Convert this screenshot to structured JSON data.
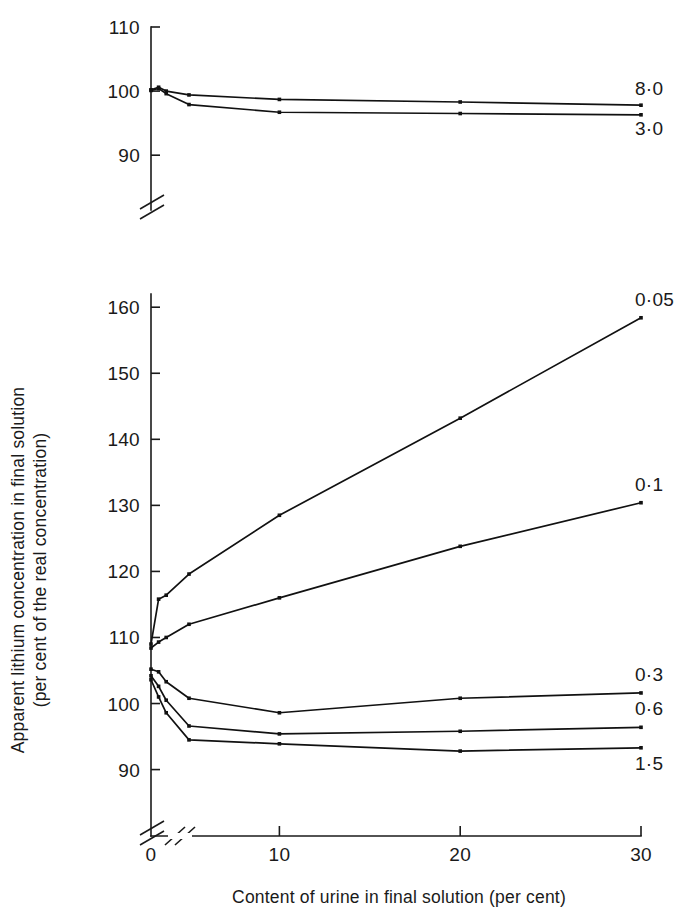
{
  "chart_data": {
    "type": "line",
    "title": "",
    "xlabel": "Content of urine in final solution (per cent)",
    "ylabel": "Apparent lithium concentration in final solution (per cent of the real concentration)",
    "ylabel_line1": "Apparent lithium concentration in final solution",
    "ylabel_line2": "(per cent of the real concentration)",
    "x": [
      0,
      1,
      2,
      5,
      10,
      20,
      30
    ],
    "xticks": [
      0,
      10,
      20,
      30
    ],
    "xticklabels": [
      "0",
      "10",
      "20",
      "30"
    ],
    "xlim": [
      0,
      30
    ],
    "grid": false,
    "legend": "right-of-line-ends",
    "axis_break_x": true,
    "panels": [
      {
        "name": "upper-panel",
        "ylim": [
          88,
          110
        ],
        "yticks": [
          90,
          100,
          110
        ],
        "yticklabels": [
          "90",
          "100",
          "110"
        ],
        "axis_break_y": true,
        "series": [
          {
            "name": "8·0",
            "label": "8·0",
            "values": [
              100.2,
              100.6,
              100.0,
              99.4,
              98.7,
              98.3,
              97.8
            ]
          },
          {
            "name": "3·0",
            "label": "3·0",
            "values": [
              100.1,
              100.4,
              99.6,
              97.9,
              96.7,
              96.5,
              96.3
            ]
          }
        ]
      },
      {
        "name": "lower-panel",
        "ylim": [
          86,
          162
        ],
        "yticks": [
          90,
          100,
          110,
          120,
          130,
          140,
          150,
          160
        ],
        "yticklabels": [
          "90",
          "100",
          "110",
          "120",
          "130",
          "140",
          "150",
          "160"
        ],
        "axis_break_y": true,
        "series": [
          {
            "name": "0·05",
            "label": "0·05",
            "values": [
              109.0,
              115.8,
              116.4,
              119.6,
              128.5,
              143.2,
              158.4
            ]
          },
          {
            "name": "0·1",
            "label": "0·1",
            "values": [
              108.4,
              109.3,
              110.0,
              112.0,
              116.0,
              123.8,
              130.4
            ]
          },
          {
            "name": "0·3",
            "label": "0·3",
            "values": [
              105.2,
              104.8,
              103.3,
              100.8,
              98.6,
              100.8,
              101.6
            ]
          },
          {
            "name": "0·6",
            "label": "0·6",
            "values": [
              104.2,
              102.6,
              100.5,
              96.6,
              95.4,
              95.8,
              96.4
            ]
          },
          {
            "name": "1·5",
            "label": "1·5",
            "values": [
              103.6,
              101.0,
              98.6,
              94.5,
              93.9,
              92.8,
              93.3
            ]
          }
        ]
      }
    ]
  },
  "labels": {
    "upper": [
      "8·0",
      "3·0"
    ],
    "lower": [
      "0·05",
      "0·1",
      "0·3",
      "0·6",
      "1·5"
    ]
  },
  "style": {
    "ink": "#111111",
    "background": "#ffffff"
  }
}
